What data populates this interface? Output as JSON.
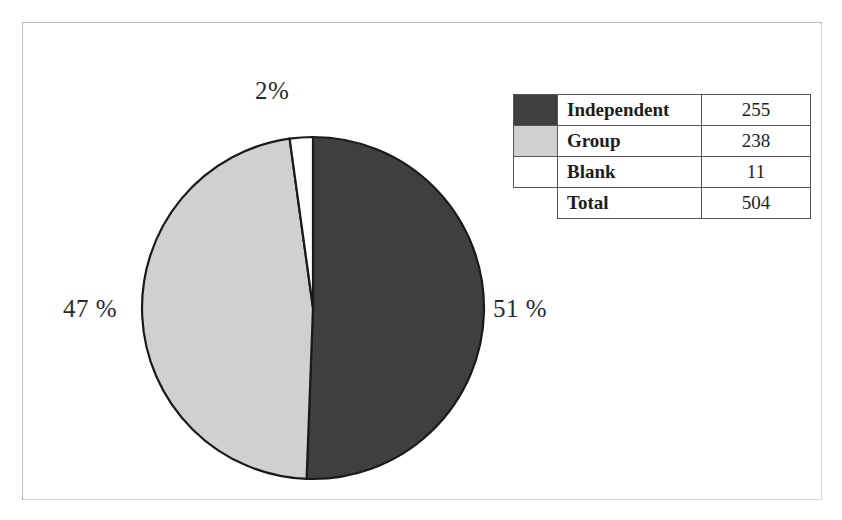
{
  "figure": {
    "frame_color": "#b9b9b9",
    "background": "#ffffff"
  },
  "chart_data": {
    "type": "pie",
    "title": "",
    "categories": [
      "Independent",
      "Group",
      "Blank"
    ],
    "values": [
      255,
      238,
      11
    ],
    "percentages": [
      51,
      47,
      2
    ],
    "labels": [
      "51 %",
      "47 %",
      "2%"
    ],
    "colors": [
      "#3f3f3f",
      "#d0d0d0",
      "#ffffff"
    ],
    "total_label": "Total",
    "total_value": 504,
    "start_angle_deg": 0,
    "direction": "clockwise",
    "slice_outline_color": "#1a1a1a",
    "legend_position": "top-right",
    "grid": false
  },
  "pie_labels": {
    "blank": "2%",
    "group": "47 %",
    "independent": "51 %"
  },
  "legend": {
    "rows": [
      {
        "label": "Independent",
        "value": "255",
        "swatch": "#3f3f3f",
        "has_swatch": true
      },
      {
        "label": "Group",
        "value": "238",
        "swatch": "#d0d0d0",
        "has_swatch": true
      },
      {
        "label": "Blank",
        "value": "11",
        "swatch": "#ffffff",
        "has_swatch": true
      },
      {
        "label": "Total",
        "value": "504",
        "swatch": "",
        "has_swatch": false
      }
    ]
  }
}
